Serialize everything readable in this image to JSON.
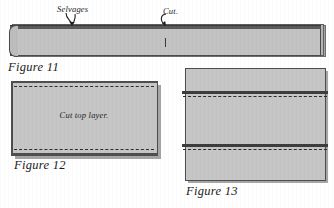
{
  "page": {
    "background_color": "#ffffff",
    "fabric_fill": "#c6c6c6",
    "edge_color": "#4d4d4d",
    "dash_color": "#2e2e2e"
  },
  "figure11": {
    "caption": "Figure 11",
    "annotations": {
      "selvages_label": "Selvages",
      "cut_label": "Cut."
    },
    "description": "Long folded fabric strip with selvage edge along top and a cut mark at center"
  },
  "figure12": {
    "caption": "Figure 12",
    "label": "Cut top layer.",
    "description": "Wide rectangle of folded fabric with dashed cutting lines near top and bottom edges"
  },
  "figure13": {
    "caption": "Figure 13",
    "description": "Tall rectangle of fabric with two horizontal dark bands each followed by a dashed line"
  }
}
